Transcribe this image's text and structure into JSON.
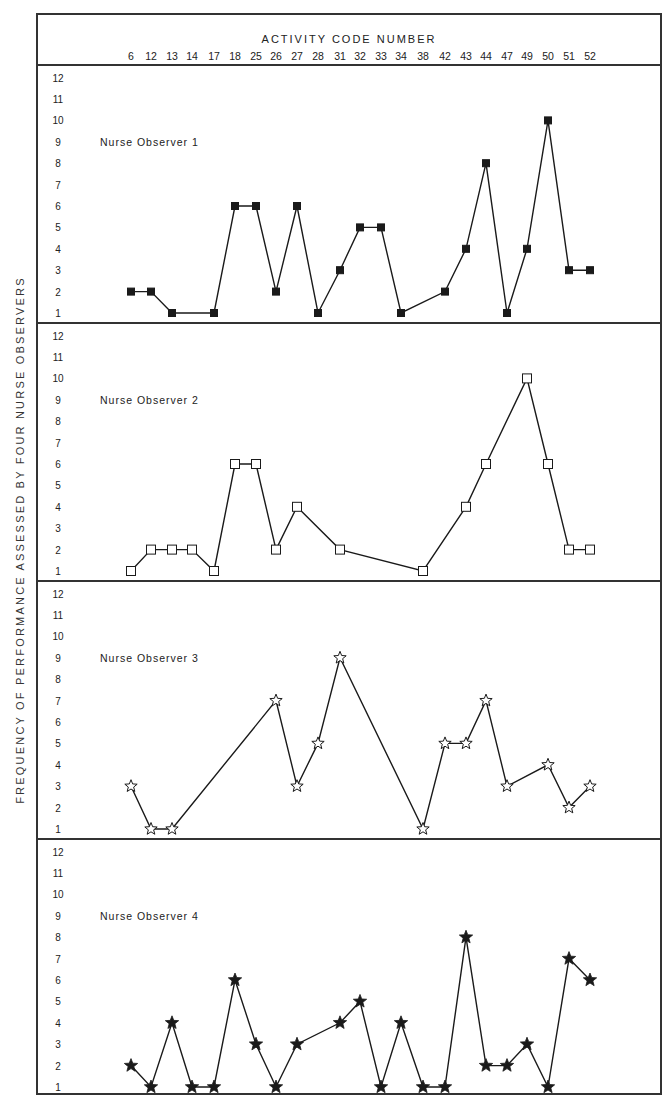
{
  "chart_data": {
    "type": "line",
    "title": "",
    "xlabel": "ACTIVITY CODE NUMBER",
    "ylabel": "FREQUENCY OF PERFORMANCE ASSESSED BY FOUR NURSE OBSERVERS",
    "categories": [
      "6",
      "12",
      "13",
      "14",
      "17",
      "18",
      "25",
      "26",
      "27",
      "28",
      "31",
      "32",
      "33",
      "34",
      "38",
      "42",
      "43",
      "44",
      "47",
      "49",
      "50",
      "51",
      "52"
    ],
    "y_ticks": [
      1,
      2,
      3,
      4,
      5,
      6,
      7,
      8,
      9,
      10,
      11,
      12
    ],
    "ylim": [
      1,
      12
    ],
    "grid": false,
    "layout": "four stacked panels sharing x-axis",
    "series": [
      {
        "name": "Nurse Observer 1",
        "marker": "filled-square",
        "points": [
          [
            "6",
            2
          ],
          [
            "12",
            2
          ],
          [
            "13",
            1
          ],
          [
            "17",
            1
          ],
          [
            "18",
            6
          ],
          [
            "25",
            6
          ],
          [
            "26",
            2
          ],
          [
            "27",
            6
          ],
          [
            "28",
            1
          ],
          [
            "31",
            3
          ],
          [
            "32",
            5
          ],
          [
            "33",
            5
          ],
          [
            "34",
            1
          ],
          [
            "42",
            2
          ],
          [
            "43",
            4
          ],
          [
            "44",
            8
          ],
          [
            "47",
            1
          ],
          [
            "49",
            4
          ],
          [
            "50",
            10
          ],
          [
            "51",
            3
          ],
          [
            "52",
            3
          ]
        ]
      },
      {
        "name": "Nurse Observer 2",
        "marker": "open-square",
        "points": [
          [
            "6",
            1
          ],
          [
            "12",
            2
          ],
          [
            "13",
            2
          ],
          [
            "14",
            2
          ],
          [
            "17",
            1
          ],
          [
            "18",
            6
          ],
          [
            "25",
            6
          ],
          [
            "26",
            2
          ],
          [
            "27",
            4
          ],
          [
            "31",
            2
          ],
          [
            "38",
            1
          ],
          [
            "43",
            4
          ],
          [
            "44",
            6
          ],
          [
            "49",
            10
          ],
          [
            "50",
            6
          ],
          [
            "51",
            2
          ],
          [
            "52",
            2
          ]
        ]
      },
      {
        "name": "Nurse Observer 3",
        "marker": "open-star",
        "points": [
          [
            "6",
            3
          ],
          [
            "12",
            1
          ],
          [
            "13",
            1
          ],
          [
            "26",
            7
          ],
          [
            "27",
            3
          ],
          [
            "28",
            5
          ],
          [
            "31",
            9
          ],
          [
            "38",
            1
          ],
          [
            "42",
            5
          ],
          [
            "43",
            5
          ],
          [
            "44",
            7
          ],
          [
            "47",
            3
          ],
          [
            "50",
            4
          ],
          [
            "51",
            2
          ],
          [
            "52",
            3
          ]
        ]
      },
      {
        "name": "Nurse Observer 4",
        "marker": "filled-star",
        "points": [
          [
            "6",
            2
          ],
          [
            "12",
            1
          ],
          [
            "13",
            4
          ],
          [
            "14",
            1
          ],
          [
            "17",
            1
          ],
          [
            "18",
            6
          ],
          [
            "25",
            3
          ],
          [
            "26",
            1
          ],
          [
            "27",
            3
          ],
          [
            "31",
            4
          ],
          [
            "32",
            5
          ],
          [
            "33",
            1
          ],
          [
            "34",
            4
          ],
          [
            "38",
            1
          ],
          [
            "42",
            1
          ],
          [
            "43",
            8
          ],
          [
            "44",
            2
          ],
          [
            "47",
            2
          ],
          [
            "49",
            3
          ],
          [
            "50",
            1
          ],
          [
            "51",
            7
          ],
          [
            "52",
            6
          ]
        ]
      }
    ]
  },
  "labels": {
    "header_title": "ACTIVITY CODE NUMBER",
    "y_axis_title": "FREQUENCY OF PERFORMANCE ASSESSED BY FOUR NURSE OBSERVERS"
  },
  "colors": {
    "line": "#1a1a1a",
    "frame": "#333333",
    "text": "#222222",
    "background": "#ffffff"
  }
}
